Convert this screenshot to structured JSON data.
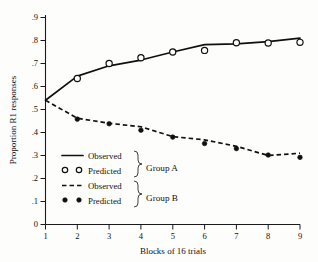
{
  "chart_data": {
    "type": "line",
    "title": "",
    "xlabel": "Blocks of 16 trials",
    "ylabel": "Proportion R1 responses",
    "xlim": [
      1,
      9
    ],
    "ylim": [
      0,
      0.9
    ],
    "grid": false,
    "legend_position": "inside-lower-left",
    "x": [
      1,
      2,
      3,
      4,
      5,
      6,
      7,
      8,
      9
    ],
    "xticklabels": [
      "1",
      "2",
      "3",
      "4",
      "5",
      "6",
      "7",
      "8",
      "9"
    ],
    "yticks": [
      0,
      0.1,
      0.2,
      0.3,
      0.4,
      0.5,
      0.6,
      0.7,
      0.8,
      0.9
    ],
    "yticklabels": [
      "0",
      ".1",
      ".2",
      ".3",
      ".4",
      ".5",
      ".6",
      ".7",
      ".8",
      ".9"
    ],
    "series": [
      {
        "name": "Group A Observed",
        "group": "Group A",
        "kind": "observed",
        "style": "solid-line",
        "values": [
          0.54,
          0.645,
          0.69,
          0.715,
          0.75,
          0.782,
          0.785,
          0.795,
          0.81
        ]
      },
      {
        "name": "Group A Predicted",
        "group": "Group A",
        "kind": "predicted",
        "style": "open-circle",
        "values": [
          null,
          0.635,
          0.7,
          0.725,
          0.75,
          0.757,
          0.79,
          0.789,
          0.792
        ]
      },
      {
        "name": "Group B Observed",
        "group": "Group B",
        "kind": "observed",
        "style": "dashed-line",
        "values": [
          0.54,
          0.462,
          0.44,
          0.425,
          0.382,
          0.368,
          0.34,
          0.3,
          0.31
        ]
      },
      {
        "name": "Group B Predicted",
        "group": "Group B",
        "kind": "predicted",
        "style": "filled-circle",
        "values": [
          null,
          0.458,
          0.438,
          0.41,
          0.38,
          0.352,
          0.33,
          0.302,
          0.292
        ]
      }
    ]
  },
  "axes": {
    "y_label": "Proportion R1 responses",
    "x_label": "Blocks of 16 trials",
    "y_tick_labels": [
      "0",
      ".1",
      ".2",
      ".3",
      ".4",
      ".5",
      ".6",
      ".7",
      ".8",
      ".9"
    ],
    "x_tick_labels": [
      "1",
      "2",
      "3",
      "4",
      "5",
      "6",
      "7",
      "8",
      "9"
    ]
  },
  "legend": {
    "entries": [
      {
        "label": "Observed",
        "style": "solid-line"
      },
      {
        "label": "Predicted",
        "style": "open-circle"
      },
      {
        "label": "Observed",
        "style": "dashed-line"
      },
      {
        "label": "Predicted",
        "style": "filled-circle"
      }
    ],
    "group_a_label": "Group A",
    "group_b_label": "Group B"
  },
  "colors": {
    "ink": "#101010",
    "paper": "#fdfdfc"
  }
}
